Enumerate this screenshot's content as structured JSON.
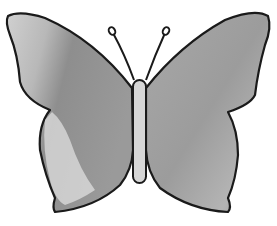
{
  "image": {
    "subject": "butterfly drawing",
    "style": "grayscale shaded illustration with black outline",
    "colors": {
      "background": "#ffffff",
      "outline": "#1a1a1a",
      "wing_light": "#e6e6e6",
      "wing_mid": "#a8a8a8",
      "wing_dark": "#8a8a8a",
      "body": "#d4d4d4"
    }
  }
}
